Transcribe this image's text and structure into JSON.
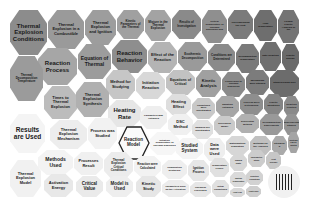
{
  "diagram": {
    "type": "voronoi-treemap",
    "palette": {
      "dark": "#6e6e6e",
      "mid": "#a3a3a3",
      "light": "#d6d6d6",
      "pale": "#eeeeee",
      "border": "#ffffff",
      "highlight": "#222222"
    },
    "cells": [
      {
        "id": "c1",
        "label": "Thermal Explosion Conditions",
        "x": 0,
        "y": 0,
        "w": 38,
        "h": 46,
        "fs": 6,
        "shade": "#8c8c8c"
      },
      {
        "id": "c2",
        "label": "Thermal Explosion in a Combustible",
        "x": 38,
        "y": 0,
        "w": 37,
        "h": 40,
        "fs": 4,
        "shade": "#9a9a9a"
      },
      {
        "id": "c3",
        "label": "Thermal Explosion and Ignition",
        "x": 75,
        "y": 0,
        "w": 32,
        "h": 36,
        "fs": 4,
        "shade": "#9d9d9d"
      },
      {
        "id": "c4",
        "label": "Kinetic Parameters of the Thermal",
        "x": 107,
        "y": 0,
        "w": 28,
        "h": 30,
        "fs": 3,
        "shade": "#a0a0a0"
      },
      {
        "id": "c5",
        "label": "Mixture in the Thermal Explosion",
        "x": 135,
        "y": 0,
        "w": 27,
        "h": 32,
        "fs": 3,
        "shade": "#a3a3a3"
      },
      {
        "id": "c6",
        "label": "Results of Investigation",
        "x": 162,
        "y": 0,
        "w": 30,
        "h": 30,
        "fs": 3,
        "shade": "#8a8a8a"
      },
      {
        "id": "c7",
        "label": "Critical Temperature of Thermal Explosion and",
        "x": 192,
        "y": 0,
        "w": 26,
        "h": 34,
        "fs": 2.5,
        "shade": "#8f8f8f"
      },
      {
        "id": "c8",
        "label": "Corresponding the Heat",
        "x": 218,
        "y": 0,
        "w": 26,
        "h": 30,
        "fs": 2.5,
        "shade": "#7b7b7b"
      },
      {
        "id": "c9",
        "label": "High Temperature",
        "x": 244,
        "y": 0,
        "w": 24,
        "h": 32,
        "fs": 2.5,
        "shade": "#6e6e6e"
      },
      {
        "id": "c10",
        "label": "Formal Kinetic Analysis of the",
        "x": 268,
        "y": 0,
        "w": 22,
        "h": 34,
        "fs": 2.5,
        "shade": "#747474"
      },
      {
        "id": "c11",
        "label": "Reaction Process",
        "x": 28,
        "y": 38,
        "w": 40,
        "h": 38,
        "fs": 6,
        "shade": "#a6a6a6"
      },
      {
        "id": "c12",
        "label": "Equation of Thermal",
        "x": 68,
        "y": 34,
        "w": 34,
        "h": 36,
        "fs": 5,
        "shade": "#9c9c9c"
      },
      {
        "id": "c13",
        "label": "Reaction Behavior",
        "x": 102,
        "y": 30,
        "w": 36,
        "h": 34,
        "fs": 6,
        "shade": "#8e8e8e"
      },
      {
        "id": "c14",
        "label": "Effect of the Reaction",
        "x": 138,
        "y": 32,
        "w": 30,
        "h": 32,
        "fs": 4,
        "shade": "#b4b4b4"
      },
      {
        "id": "c15",
        "label": "Exothermic Decomposition",
        "x": 168,
        "y": 32,
        "w": 30,
        "h": 30,
        "fs": 3,
        "shade": "#9a9a9a"
      },
      {
        "id": "c16",
        "label": "Conditions are Determined",
        "x": 198,
        "y": 34,
        "w": 28,
        "h": 28,
        "fs": 3,
        "shade": "#8a8a8a"
      },
      {
        "id": "c17",
        "label": "Decomposition Temperature",
        "x": 226,
        "y": 34,
        "w": 24,
        "h": 30,
        "fs": 2.5,
        "shade": "#7a7a7a"
      },
      {
        "id": "c18",
        "label": "Rate Reaction",
        "x": 250,
        "y": 32,
        "w": 22,
        "h": 30,
        "fs": 2.5,
        "shade": "#6f6f6f"
      },
      {
        "id": "c19",
        "label": "Kinetic Energy",
        "x": 272,
        "y": 34,
        "w": 18,
        "h": 28,
        "fs": 2.5,
        "shade": "#6a6a6a"
      },
      {
        "id": "c20",
        "label": "Thermal Decomposition Temperature",
        "x": 0,
        "y": 46,
        "w": 34,
        "h": 46,
        "fs": 3,
        "shade": "#9b9b9b"
      },
      {
        "id": "c21",
        "label": "Method for Studying",
        "x": 96,
        "y": 60,
        "w": 30,
        "h": 30,
        "fs": 4,
        "shade": "#c6c6c6"
      },
      {
        "id": "c22",
        "label": "Initiation Reaction",
        "x": 126,
        "y": 62,
        "w": 30,
        "h": 28,
        "fs": 4,
        "shade": "#d8d8d8"
      },
      {
        "id": "c23",
        "label": "Equations of Critical",
        "x": 156,
        "y": 60,
        "w": 30,
        "h": 26,
        "fs": 3.5,
        "shade": "#c2c2c2"
      },
      {
        "id": "c24",
        "label": "Kinetic Analysis",
        "x": 186,
        "y": 60,
        "w": 26,
        "h": 28,
        "fs": 4,
        "shade": "#a0a0a0"
      },
      {
        "id": "c25",
        "label": "Conversion to Thermal Explosion",
        "x": 212,
        "y": 62,
        "w": 24,
        "h": 26,
        "fs": 2.5,
        "shade": "#8a8a8a"
      },
      {
        "id": "c26",
        "label": "Mechanism were Studied",
        "x": 236,
        "y": 60,
        "w": 24,
        "h": 26,
        "fs": 2.5,
        "shade": "#7c7c7c"
      },
      {
        "id": "c27",
        "label": "Studied using DSC",
        "x": 260,
        "y": 60,
        "w": 30,
        "h": 28,
        "fs": 2.5,
        "shade": "#6c6c6c"
      },
      {
        "id": "c28",
        "label": "Times to Thermal Explosion",
        "x": 34,
        "y": 76,
        "w": 34,
        "h": 34,
        "fs": 4,
        "shade": "#bcbcbc"
      },
      {
        "id": "c29",
        "label": "Thermal Explosion Synthesis",
        "x": 66,
        "y": 72,
        "w": 34,
        "h": 36,
        "fs": 4,
        "shade": "#b0b0b0"
      },
      {
        "id": "c30",
        "label": "Heating Rate",
        "x": 98,
        "y": 90,
        "w": 34,
        "h": 28,
        "fs": 6,
        "shade": "#e6e6e6"
      },
      {
        "id": "c31",
        "label": "Parameters was Obtained",
        "x": 130,
        "y": 96,
        "w": 28,
        "h": 24,
        "fs": 2.5,
        "shade": "#eeeeee"
      },
      {
        "id": "c32",
        "label": "Heating Effect",
        "x": 156,
        "y": 84,
        "w": 26,
        "h": 22,
        "fs": 4,
        "shade": "#dedede"
      },
      {
        "id": "c33",
        "label": "Conditions were Investigated",
        "x": 182,
        "y": 88,
        "w": 24,
        "h": 22,
        "fs": 2.5,
        "shade": "#c8c8c8"
      },
      {
        "id": "c34",
        "label": "Equation Obtained",
        "x": 206,
        "y": 86,
        "w": 24,
        "h": 22,
        "fs": 2.5,
        "shade": "#a6a6a6"
      },
      {
        "id": "c35",
        "label": "Process were Determined",
        "x": 230,
        "y": 84,
        "w": 24,
        "h": 22,
        "fs": 2.5,
        "shade": "#8e8e8e"
      },
      {
        "id": "c36",
        "label": "Kinetic Equations",
        "x": 254,
        "y": 84,
        "w": 20,
        "h": 22,
        "fs": 2.5,
        "shade": "#858585"
      },
      {
        "id": "c37",
        "label": "Reaction Kinetics",
        "x": 274,
        "y": 86,
        "w": 16,
        "h": 22,
        "fs": 2.5,
        "shade": "#8a8a8a"
      },
      {
        "id": "c38",
        "label": "Results are Used",
        "x": 0,
        "y": 104,
        "w": 36,
        "h": 40,
        "fs": 6.5,
        "shade": "#f4f4f4"
      },
      {
        "id": "c39",
        "label": "Thermal Explosion Mechanism",
        "x": 40,
        "y": 110,
        "w": 38,
        "h": 30,
        "fs": 4,
        "shade": "#ededed"
      },
      {
        "id": "c40",
        "label": "Process was Studied",
        "x": 78,
        "y": 108,
        "w": 30,
        "h": 32,
        "fs": 4,
        "shade": "#f2f2f2"
      },
      {
        "id": "c41",
        "label": "Reaction Model",
        "x": 108,
        "y": 116,
        "w": 32,
        "h": 34,
        "fs": 4.5,
        "shade": "#fafafa",
        "highlight": true
      },
      {
        "id": "c42",
        "label": "Initiation Temperature of Thermal Explosion",
        "x": 140,
        "y": 122,
        "w": 30,
        "h": 24,
        "fs": 2.5,
        "shade": "#f6f6f6"
      },
      {
        "id": "c43",
        "label": "DSC Method",
        "x": 158,
        "y": 104,
        "w": 26,
        "h": 22,
        "fs": 4,
        "shade": "#f0f0f0"
      },
      {
        "id": "c44",
        "label": "Samples are Investigated",
        "x": 182,
        "y": 110,
        "w": 22,
        "h": 20,
        "fs": 2.5,
        "shade": "#e0e0e0"
      },
      {
        "id": "c45",
        "label": "Developed Model",
        "x": 204,
        "y": 106,
        "w": 22,
        "h": 20,
        "fs": 2.5,
        "shade": "#cacaca"
      },
      {
        "id": "c46",
        "label": "Differential Method",
        "x": 226,
        "y": 104,
        "w": 24,
        "h": 20,
        "fs": 2.5,
        "shade": "#b0b0b0"
      },
      {
        "id": "c47",
        "label": "Decomposition Experiments",
        "x": 250,
        "y": 104,
        "w": 24,
        "h": 22,
        "fs": 2.5,
        "shade": "#999999"
      },
      {
        "id": "c48",
        "label": "Experimental Studies",
        "x": 274,
        "y": 104,
        "w": 16,
        "h": 22,
        "fs": 2.5,
        "shade": "#939393"
      },
      {
        "id": "c49",
        "label": "Studied System",
        "x": 166,
        "y": 128,
        "w": 28,
        "h": 22,
        "fs": 4.5,
        "shade": "#f4f4f4"
      },
      {
        "id": "c50",
        "label": "Data were Used",
        "x": 194,
        "y": 128,
        "w": 22,
        "h": 24,
        "fs": 4,
        "shade": "#eeeeee"
      },
      {
        "id": "c51",
        "label": "Mathematical Simulation",
        "x": 216,
        "y": 126,
        "w": 24,
        "h": 20,
        "fs": 2.5,
        "shade": "#d6d6d6"
      },
      {
        "id": "c52",
        "label": "Methods for the Analysis",
        "x": 240,
        "y": 126,
        "w": 22,
        "h": 20,
        "fs": 2.5,
        "shade": "#c0c0c0"
      },
      {
        "id": "c53",
        "label": "Stepwise E",
        "x": 262,
        "y": 126,
        "w": 16,
        "h": 20,
        "fs": 2.5,
        "shade": "#aaaaaa"
      },
      {
        "id": "c54",
        "label": "Systems can be Ignited",
        "x": 278,
        "y": 122,
        "w": 12,
        "h": 22,
        "fs": 2,
        "shade": "#a4a4a4"
      },
      {
        "id": "c55",
        "label": "Methods Used",
        "x": 28,
        "y": 140,
        "w": 36,
        "h": 26,
        "fs": 5,
        "shade": "#f3f3f3"
      },
      {
        "id": "c56",
        "label": "Processes Result",
        "x": 64,
        "y": 142,
        "w": 30,
        "h": 24,
        "fs": 4,
        "shade": "#f0f0f0"
      },
      {
        "id": "c57",
        "label": "Thermal Explosion Critical Conditions",
        "x": 94,
        "y": 142,
        "w": 30,
        "h": 28,
        "fs": 3,
        "shade": "#ececec"
      },
      {
        "id": "c58",
        "label": "Reaction were Calculated",
        "x": 124,
        "y": 146,
        "w": 28,
        "h": 22,
        "fs": 3,
        "shade": "#f2f2f2"
      },
      {
        "id": "c59",
        "label": "Combustion Synthesis",
        "x": 152,
        "y": 150,
        "w": 26,
        "h": 20,
        "fs": 2.5,
        "shade": "#eeeeee"
      },
      {
        "id": "c60",
        "label": "Ignition Process",
        "x": 178,
        "y": 150,
        "w": 22,
        "h": 22,
        "fs": 3,
        "shade": "#e6e6e6"
      },
      {
        "id": "c61",
        "label": "Temperature Profile",
        "x": 200,
        "y": 148,
        "w": 20,
        "h": 20,
        "fs": 2.5,
        "shade": "#e0e0e0"
      },
      {
        "id": "c62",
        "label": "Rapid Rate",
        "x": 220,
        "y": 144,
        "w": 18,
        "h": 18,
        "fs": 2.5,
        "shade": "#d6d6d6"
      },
      {
        "id": "c63",
        "label": "Calorimetric Study",
        "x": 238,
        "y": 140,
        "w": 18,
        "h": 18,
        "fs": 2,
        "shade": "#cccccc"
      },
      {
        "id": "c64",
        "label": "Heat Release",
        "x": 256,
        "y": 142,
        "w": 16,
        "h": 18,
        "fs": 2,
        "shade": "#c6c6c6"
      },
      {
        "id": "c65",
        "label": "Thermal Explosion Model",
        "x": 0,
        "y": 150,
        "w": 32,
        "h": 38,
        "fs": 4,
        "shade": "#f1f1f1"
      },
      {
        "id": "c66",
        "label": "Activation Energy",
        "x": 34,
        "y": 164,
        "w": 30,
        "h": 24,
        "fs": 4,
        "shade": "#e8e8e8"
      },
      {
        "id": "c67",
        "label": "Critical Value",
        "x": 66,
        "y": 166,
        "w": 28,
        "h": 22,
        "fs": 4.5,
        "shade": "#eaeaea"
      },
      {
        "id": "c68",
        "label": "Model is Used",
        "x": 96,
        "y": 166,
        "w": 28,
        "h": 22,
        "fs": 4.5,
        "shade": "#eeeeee"
      },
      {
        "id": "c69",
        "label": "Kinetic Study",
        "x": 126,
        "y": 166,
        "w": 26,
        "h": 22,
        "fs": 4,
        "shade": "#e6e6e6"
      },
      {
        "id": "c70",
        "label": "Parameters such as the Activation",
        "x": 152,
        "y": 170,
        "w": 28,
        "h": 18,
        "fs": 2.5,
        "shade": "#ececec"
      },
      {
        "id": "c71",
        "label": "Chemical Processes",
        "x": 180,
        "y": 172,
        "w": 22,
        "h": 16,
        "fs": 2.5,
        "shade": "#e6e6e6"
      },
      {
        "id": "c72",
        "label": "Initial Conditions",
        "x": 202,
        "y": 170,
        "w": 18,
        "h": 18,
        "fs": 2.5,
        "shade": "#e0e0e0"
      },
      {
        "id": "c73",
        "label": "Ignition Temperature",
        "x": 220,
        "y": 162,
        "w": 18,
        "h": 16,
        "fs": 2,
        "shade": "#dadada"
      },
      {
        "id": "c74",
        "label": "Heat Flux",
        "x": 220,
        "y": 178,
        "w": 16,
        "h": 10,
        "fs": 2,
        "shade": "#d8d8d8"
      },
      {
        "id": "c75",
        "label": "Reaction Conditions",
        "x": 236,
        "y": 160,
        "w": 18,
        "h": 16,
        "fs": 2,
        "shade": "#d2d2d2"
      },
      {
        "id": "c76",
        "label": "Heat Loss",
        "x": 236,
        "y": 176,
        "w": 16,
        "h": 12,
        "fs": 2,
        "shade": "#cecece"
      }
    ],
    "logo": {
      "x": 258,
      "y": 156,
      "size": 32,
      "label": "logo"
    }
  }
}
